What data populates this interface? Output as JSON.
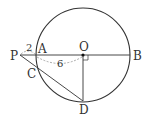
{
  "diagram": {
    "title": "",
    "colors": {
      "stroke": "#333333",
      "dash": "#888888",
      "text": "#333333"
    },
    "points": {
      "P": {
        "label": "P",
        "x": 20,
        "y": 55
      },
      "A": {
        "label": "A",
        "x": 36,
        "y": 55
      },
      "O": {
        "label": "O",
        "x": 83,
        "y": 55
      },
      "B": {
        "label": "B",
        "x": 130,
        "y": 55
      },
      "C": {
        "label": "C",
        "x": 37,
        "y": 69
      },
      "D": {
        "label": "D",
        "x": 83,
        "y": 101
      }
    },
    "circle": {
      "cx": 83,
      "cy": 55,
      "r": 47
    },
    "measurements": {
      "PA": "2",
      "AO": "6"
    },
    "annotations": {
      "right_angle_at": "O"
    }
  }
}
